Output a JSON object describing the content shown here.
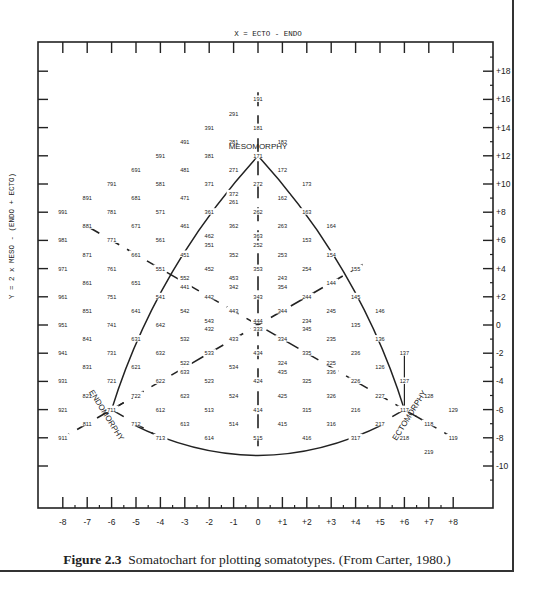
{
  "figure": {
    "caption_label": "Figure 2.3",
    "caption_text": "Somatochart for plotting somatotypes. (From Carter, 1980.)"
  },
  "chart_data": {
    "type": "scatter",
    "title": "Somatochart",
    "xlabel": "X = ECTO - ENDO",
    "ylabel": "Y = 2 x MESO - (ENDO + ECTO)",
    "xlim": [
      -8,
      8
    ],
    "ylim": [
      -10,
      18
    ],
    "x_ticks": [
      "-8",
      "-7",
      "-6",
      "-5",
      "-4",
      "-3",
      "-2",
      "-1",
      "0",
      "+1",
      "+2",
      "+3",
      "+4",
      "+5",
      "+6",
      "+7",
      "+8"
    ],
    "y_ticks": [
      "+18",
      "+16",
      "+14",
      "+12",
      "+10",
      "+8",
      "+6",
      "+4",
      "+2",
      "0",
      "-2",
      "-4",
      "-6",
      "-8",
      "-10"
    ],
    "regions": [
      {
        "label": "MESOMORPHY",
        "x": 0,
        "y": 12.5
      },
      {
        "label": "ENDOMORPHY",
        "x": -6.3,
        "y": -6.5,
        "rotate": 58
      },
      {
        "label": "ECTOMORPHY",
        "x": 6.3,
        "y": -6.5,
        "rotate": -58
      }
    ],
    "grid": false,
    "points": [
      {
        "label": "191",
        "x": 0,
        "y": 16
      },
      {
        "label": "291",
        "x": -1,
        "y": 15
      },
      {
        "label": "181",
        "x": 0,
        "y": 14
      },
      {
        "label": "391",
        "x": -2,
        "y": 14
      },
      {
        "label": "491",
        "x": -3,
        "y": 13
      },
      {
        "label": "281",
        "x": -1,
        "y": 13
      },
      {
        "label": "182",
        "x": 1,
        "y": 13
      },
      {
        "label": "591",
        "x": -4,
        "y": 12
      },
      {
        "label": "381",
        "x": -2,
        "y": 12
      },
      {
        "label": "171",
        "x": 0,
        "y": 12
      },
      {
        "label": "691",
        "x": -5,
        "y": 11
      },
      {
        "label": "481",
        "x": -3,
        "y": 11
      },
      {
        "label": "271",
        "x": -1,
        "y": 11
      },
      {
        "label": "172",
        "x": 1,
        "y": 11
      },
      {
        "label": "791",
        "x": -6,
        "y": 10
      },
      {
        "label": "581",
        "x": -4,
        "y": 10
      },
      {
        "label": "371",
        "x": -2,
        "y": 10
      },
      {
        "label": "272",
        "x": 0,
        "y": 10
      },
      {
        "label": "173",
        "x": 2,
        "y": 10
      },
      {
        "label": "891",
        "x": -7,
        "y": 9
      },
      {
        "label": "681",
        "x": -5,
        "y": 9
      },
      {
        "label": "471",
        "x": -3,
        "y": 9
      },
      {
        "label": "372",
        "x": -1,
        "y": 9.3
      },
      {
        "label": "261",
        "x": -1,
        "y": 8.7
      },
      {
        "label": "162",
        "x": 1,
        "y": 9
      },
      {
        "label": "991",
        "x": -8,
        "y": 8
      },
      {
        "label": "781",
        "x": -6,
        "y": 8
      },
      {
        "label": "571",
        "x": -4,
        "y": 8
      },
      {
        "label": "361",
        "x": -2,
        "y": 8
      },
      {
        "label": "262",
        "x": 0,
        "y": 8
      },
      {
        "label": "163",
        "x": 2,
        "y": 8
      },
      {
        "label": "881",
        "x": -7,
        "y": 7
      },
      {
        "label": "671",
        "x": -5,
        "y": 7
      },
      {
        "label": "461",
        "x": -3,
        "y": 7
      },
      {
        "label": "362",
        "x": -1,
        "y": 7
      },
      {
        "label": "263",
        "x": 1,
        "y": 7
      },
      {
        "label": "164",
        "x": 3,
        "y": 7
      },
      {
        "label": "981",
        "x": -8,
        "y": 6
      },
      {
        "label": "771",
        "x": -6,
        "y": 6
      },
      {
        "label": "561",
        "x": -4,
        "y": 6
      },
      {
        "label": "462",
        "x": -2,
        "y": 6.3
      },
      {
        "label": "351",
        "x": -2,
        "y": 5.7
      },
      {
        "label": "363",
        "x": 0,
        "y": 6.3
      },
      {
        "label": "252",
        "x": 0,
        "y": 5.7
      },
      {
        "label": "153",
        "x": 2,
        "y": 6
      },
      {
        "label": "871",
        "x": -7,
        "y": 5
      },
      {
        "label": "661",
        "x": -5,
        "y": 5
      },
      {
        "label": "451",
        "x": -3,
        "y": 5
      },
      {
        "label": "352",
        "x": -1,
        "y": 5
      },
      {
        "label": "253",
        "x": 1,
        "y": 5
      },
      {
        "label": "154",
        "x": 3,
        "y": 5
      },
      {
        "label": "971",
        "x": -8,
        "y": 4
      },
      {
        "label": "761",
        "x": -6,
        "y": 4
      },
      {
        "label": "551",
        "x": -4,
        "y": 4
      },
      {
        "label": "452",
        "x": -2,
        "y": 4
      },
      {
        "label": "353",
        "x": 0,
        "y": 4
      },
      {
        "label": "254",
        "x": 2,
        "y": 4
      },
      {
        "label": "155",
        "x": 4,
        "y": 4
      },
      {
        "label": "861",
        "x": -7,
        "y": 3
      },
      {
        "label": "651",
        "x": -5,
        "y": 3
      },
      {
        "label": "552",
        "x": -3,
        "y": 3.3
      },
      {
        "label": "441",
        "x": -3,
        "y": 2.7
      },
      {
        "label": "453",
        "x": -1,
        "y": 3.3
      },
      {
        "label": "342",
        "x": -1,
        "y": 2.7
      },
      {
        "label": "243",
        "x": 1,
        "y": 3.3
      },
      {
        "label": "354",
        "x": 1,
        "y": 2.7
      },
      {
        "label": "144",
        "x": 3,
        "y": 3
      },
      {
        "label": "961",
        "x": -8,
        "y": 2
      },
      {
        "label": "751",
        "x": -6,
        "y": 2
      },
      {
        "label": "541",
        "x": -4,
        "y": 2
      },
      {
        "label": "442",
        "x": -2,
        "y": 2
      },
      {
        "label": "343",
        "x": 0,
        "y": 2
      },
      {
        "label": "244",
        "x": 2,
        "y": 2
      },
      {
        "label": "145",
        "x": 4,
        "y": 2
      },
      {
        "label": "851",
        "x": -7,
        "y": 1
      },
      {
        "label": "641",
        "x": -5,
        "y": 1
      },
      {
        "label": "542",
        "x": -3,
        "y": 1
      },
      {
        "label": "443",
        "x": -1,
        "y": 1
      },
      {
        "label": "344",
        "x": 1,
        "y": 1
      },
      {
        "label": "245",
        "x": 3,
        "y": 1
      },
      {
        "label": "146",
        "x": 5,
        "y": 1
      },
      {
        "label": "951",
        "x": -8,
        "y": 0
      },
      {
        "label": "741",
        "x": -6,
        "y": 0
      },
      {
        "label": "642",
        "x": -4,
        "y": 0
      },
      {
        "label": "543",
        "x": -2,
        "y": 0.3
      },
      {
        "label": "432",
        "x": -2,
        "y": -0.3
      },
      {
        "label": "444",
        "x": 0,
        "y": 0.3
      },
      {
        "label": "333",
        "x": 0,
        "y": -0.3
      },
      {
        "label": "234",
        "x": 2,
        "y": 0.3
      },
      {
        "label": "345",
        "x": 2,
        "y": -0.3
      },
      {
        "label": "135",
        "x": 4,
        "y": 0
      },
      {
        "label": "841",
        "x": -7,
        "y": -1
      },
      {
        "label": "631",
        "x": -5,
        "y": -1
      },
      {
        "label": "532",
        "x": -3,
        "y": -1
      },
      {
        "label": "433",
        "x": -1,
        "y": -1
      },
      {
        "label": "334",
        "x": 1,
        "y": -1
      },
      {
        "label": "235",
        "x": 3,
        "y": -1
      },
      {
        "label": "136",
        "x": 5,
        "y": -1
      },
      {
        "label": "941",
        "x": -8,
        "y": -2
      },
      {
        "label": "731",
        "x": -6,
        "y": -2
      },
      {
        "label": "632",
        "x": -4,
        "y": -2
      },
      {
        "label": "533",
        "x": -2,
        "y": -2
      },
      {
        "label": "434",
        "x": 0,
        "y": -2
      },
      {
        "label": "335",
        "x": 2,
        "y": -2
      },
      {
        "label": "236",
        "x": 4,
        "y": -2
      },
      {
        "label": "137",
        "x": 6,
        "y": -2
      },
      {
        "label": "831",
        "x": -7,
        "y": -3
      },
      {
        "label": "621",
        "x": -5,
        "y": -3
      },
      {
        "label": "522",
        "x": -3,
        "y": -2.7
      },
      {
        "label": "633",
        "x": -3,
        "y": -3.3
      },
      {
        "label": "534",
        "x": -1,
        "y": -3
      },
      {
        "label": "324",
        "x": 1,
        "y": -2.7
      },
      {
        "label": "435",
        "x": 1,
        "y": -3.3
      },
      {
        "label": "225",
        "x": 3,
        "y": -2.7
      },
      {
        "label": "336",
        "x": 3,
        "y": -3.3
      },
      {
        "label": "126",
        "x": 5,
        "y": -3
      },
      {
        "label": "931",
        "x": -8,
        "y": -4
      },
      {
        "label": "721",
        "x": -6,
        "y": -4
      },
      {
        "label": "622",
        "x": -4,
        "y": -4
      },
      {
        "label": "523",
        "x": -2,
        "y": -4
      },
      {
        "label": "424",
        "x": 0,
        "y": -4
      },
      {
        "label": "325",
        "x": 2,
        "y": -4
      },
      {
        "label": "226",
        "x": 4,
        "y": -4
      },
      {
        "label": "127",
        "x": 6,
        "y": -4
      },
      {
        "label": "821",
        "x": -7,
        "y": -5
      },
      {
        "label": "722",
        "x": -5,
        "y": -5
      },
      {
        "label": "623",
        "x": -3,
        "y": -5
      },
      {
        "label": "524",
        "x": -1,
        "y": -5
      },
      {
        "label": "425",
        "x": 1,
        "y": -5
      },
      {
        "label": "326",
        "x": 3,
        "y": -5
      },
      {
        "label": "227",
        "x": 5,
        "y": -5
      },
      {
        "label": "128",
        "x": 7,
        "y": -5
      },
      {
        "label": "921",
        "x": -8,
        "y": -6
      },
      {
        "label": "711",
        "x": -6,
        "y": -6
      },
      {
        "label": "612",
        "x": -4,
        "y": -6
      },
      {
        "label": "513",
        "x": -2,
        "y": -6
      },
      {
        "label": "414",
        "x": 0,
        "y": -6
      },
      {
        "label": "315",
        "x": 2,
        "y": -6
      },
      {
        "label": "216",
        "x": 4,
        "y": -6
      },
      {
        "label": "117",
        "x": 6,
        "y": -6
      },
      {
        "label": "129",
        "x": 8,
        "y": -6
      },
      {
        "label": "811",
        "x": -7,
        "y": -7
      },
      {
        "label": "712",
        "x": -5,
        "y": -7
      },
      {
        "label": "613",
        "x": -3,
        "y": -7
      },
      {
        "label": "514",
        "x": -1,
        "y": -7
      },
      {
        "label": "415",
        "x": 1,
        "y": -7
      },
      {
        "label": "316",
        "x": 3,
        "y": -7
      },
      {
        "label": "217",
        "x": 5,
        "y": -7
      },
      {
        "label": "118",
        "x": 7,
        "y": -7
      },
      {
        "label": "911",
        "x": -8,
        "y": -8
      },
      {
        "label": "713",
        "x": -4,
        "y": -8
      },
      {
        "label": "614",
        "x": -2,
        "y": -8
      },
      {
        "label": "515",
        "x": 0,
        "y": -8
      },
      {
        "label": "416",
        "x": 2,
        "y": -8
      },
      {
        "label": "317",
        "x": 4,
        "y": -8
      },
      {
        "label": "218",
        "x": 6,
        "y": -8
      },
      {
        "label": "119",
        "x": 8,
        "y": -8
      },
      {
        "label": "219",
        "x": 7,
        "y": -9
      }
    ],
    "axis_lines": [
      {
        "name": "meso-axis",
        "from": [
          0,
          16
        ],
        "to": [
          0,
          -8
        ]
      },
      {
        "name": "endo-axis",
        "from": [
          -6,
          -6
        ],
        "to": [
          6,
          6
        ],
        "note": "dashed line 711-444 extended toward 155"
      },
      {
        "name": "ecto-axis",
        "from": [
          6,
          -6
        ],
        "to": [
          -7,
          7
        ],
        "note": "dashed line 117-444 extended toward 881"
      }
    ],
    "curves": [
      "reuleaux-triangle bounding arcs through 171, 711 and 117"
    ]
  }
}
